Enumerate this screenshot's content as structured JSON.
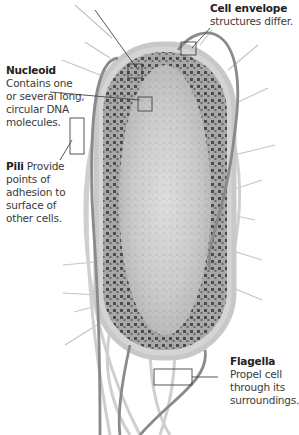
{
  "labels": {
    "cell_envelope": {
      "title": "Cell envelope",
      "text": "structures differ."
    },
    "nucleoid": {
      "title": "Nucleoid",
      "lines": [
        "Contains one",
        "or several long,",
        "circular DNA",
        "molecules."
      ]
    },
    "pili": {
      "title": "Pili",
      "first_line_text": "Provide",
      "lines": [
        "points of",
        "adhesion to",
        "surface of",
        "other cells."
      ]
    },
    "flagella": {
      "title": "Flagella",
      "lines": [
        "Propel cell",
        "through its",
        "surroundings."
      ]
    }
  },
  "colors": {
    "background": "#ffffff",
    "cell_body": "#bdbdbd",
    "cell_edge": "#d0d0d0",
    "dna_granules": "#555555",
    "flagellum": "#8a8a8a",
    "pilus": "#b0b0b0",
    "leader_line": "#444444"
  }
}
